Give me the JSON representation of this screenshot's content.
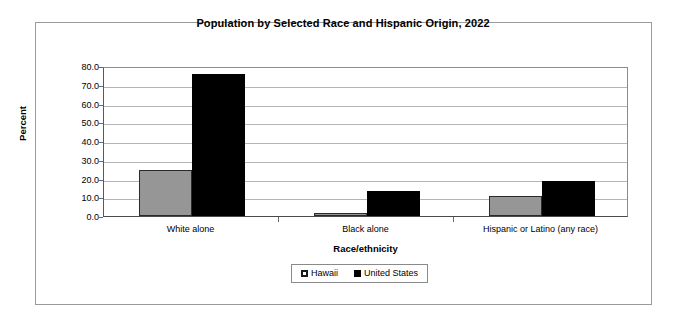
{
  "chart_data": {
    "type": "bar",
    "title": "Population by Selected Race and Hispanic Origin, 2022",
    "xlabel": "Race/ethnicity",
    "ylabel": "Percent",
    "categories": [
      "White alone",
      "Black alone",
      "Hispanic or Latino (any race)"
    ],
    "series": [
      {
        "name": "Hawaii",
        "color": "#969696",
        "values": [
          24.8,
          1.8,
          10.9
        ]
      },
      {
        "name": "United States",
        "color": "#000000",
        "values": [
          75.5,
          13.6,
          18.9
        ]
      }
    ],
    "ylim": [
      0,
      80
    ],
    "ytick_labels": [
      "0.0",
      "10.0",
      "20.0",
      "30.0",
      "40.0",
      "50.0",
      "60.0",
      "70.0",
      "80.0"
    ],
    "ytick_values": [
      0,
      10,
      20,
      30,
      40,
      50,
      60,
      70,
      80
    ],
    "grid": true,
    "legend_position": "bottom-center"
  }
}
